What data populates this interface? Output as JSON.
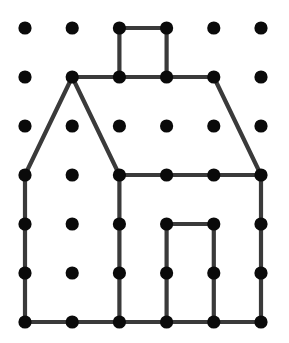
{
  "figure": {
    "name": "geoboard-house",
    "canvas": {
      "width": 289,
      "height": 343,
      "background": "#ffffff"
    },
    "grid": {
      "columns": 6,
      "rows": 7,
      "origin_x": 25,
      "origin_y": 28,
      "spacing_x": 47.2,
      "spacing_y": 49.0,
      "dot_radius": 6.6,
      "dot_color": "#0a0a0a",
      "dot_count": 42
    },
    "stroke": {
      "color": "#3a3a3a",
      "width": 4.2,
      "linecap": "round",
      "linejoin": "round"
    },
    "dots": [
      {
        "col": 0,
        "row": 0
      },
      {
        "col": 1,
        "row": 0
      },
      {
        "col": 2,
        "row": 0
      },
      {
        "col": 3,
        "row": 0
      },
      {
        "col": 4,
        "row": 0
      },
      {
        "col": 5,
        "row": 0
      },
      {
        "col": 0,
        "row": 1
      },
      {
        "col": 1,
        "row": 1
      },
      {
        "col": 2,
        "row": 1
      },
      {
        "col": 3,
        "row": 1
      },
      {
        "col": 4,
        "row": 1
      },
      {
        "col": 5,
        "row": 1
      },
      {
        "col": 0,
        "row": 2
      },
      {
        "col": 1,
        "row": 2
      },
      {
        "col": 2,
        "row": 2
      },
      {
        "col": 3,
        "row": 2
      },
      {
        "col": 4,
        "row": 2
      },
      {
        "col": 5,
        "row": 2
      },
      {
        "col": 0,
        "row": 3
      },
      {
        "col": 1,
        "row": 3
      },
      {
        "col": 2,
        "row": 3
      },
      {
        "col": 3,
        "row": 3
      },
      {
        "col": 4,
        "row": 3
      },
      {
        "col": 5,
        "row": 3
      },
      {
        "col": 0,
        "row": 4
      },
      {
        "col": 1,
        "row": 4
      },
      {
        "col": 2,
        "row": 4
      },
      {
        "col": 3,
        "row": 4
      },
      {
        "col": 4,
        "row": 4
      },
      {
        "col": 5,
        "row": 4
      },
      {
        "col": 0,
        "row": 5
      },
      {
        "col": 1,
        "row": 5
      },
      {
        "col": 2,
        "row": 5
      },
      {
        "col": 3,
        "row": 5
      },
      {
        "col": 4,
        "row": 5
      },
      {
        "col": 5,
        "row": 5
      },
      {
        "col": 0,
        "row": 6
      },
      {
        "col": 1,
        "row": 6
      },
      {
        "col": 2,
        "row": 6
      },
      {
        "col": 3,
        "row": 6
      },
      {
        "col": 4,
        "row": 6
      },
      {
        "col": 5,
        "row": 6
      }
    ],
    "segments": [
      {
        "name": "chimney-top",
        "from": {
          "col": 2,
          "row": 0
        },
        "to": {
          "col": 3,
          "row": 0
        }
      },
      {
        "name": "chimney-left",
        "from": {
          "col": 2,
          "row": 0
        },
        "to": {
          "col": 2,
          "row": 1
        }
      },
      {
        "name": "chimney-right",
        "from": {
          "col": 3,
          "row": 0
        },
        "to": {
          "col": 3,
          "row": 1
        }
      },
      {
        "name": "roof-ridge",
        "from": {
          "col": 1,
          "row": 1
        },
        "to": {
          "col": 4,
          "row": 1
        }
      },
      {
        "name": "roof-slope-left",
        "from": {
          "col": 1,
          "row": 1
        },
        "to": {
          "col": 0,
          "row": 3
        }
      },
      {
        "name": "roof-slope-inner",
        "from": {
          "col": 1,
          "row": 1
        },
        "to": {
          "col": 2,
          "row": 3
        }
      },
      {
        "name": "roof-slope-right",
        "from": {
          "col": 4,
          "row": 1
        },
        "to": {
          "col": 5,
          "row": 3
        }
      },
      {
        "name": "eaves-line",
        "from": {
          "col": 2,
          "row": 3
        },
        "to": {
          "col": 5,
          "row": 3
        }
      },
      {
        "name": "wall-left",
        "from": {
          "col": 0,
          "row": 3
        },
        "to": {
          "col": 0,
          "row": 6
        }
      },
      {
        "name": "wall-middle",
        "from": {
          "col": 2,
          "row": 3
        },
        "to": {
          "col": 2,
          "row": 6
        }
      },
      {
        "name": "wall-right",
        "from": {
          "col": 5,
          "row": 3
        },
        "to": {
          "col": 5,
          "row": 6
        }
      },
      {
        "name": "door-top",
        "from": {
          "col": 3,
          "row": 4
        },
        "to": {
          "col": 4,
          "row": 4
        }
      },
      {
        "name": "door-left",
        "from": {
          "col": 3,
          "row": 4
        },
        "to": {
          "col": 3,
          "row": 6
        }
      },
      {
        "name": "door-right",
        "from": {
          "col": 4,
          "row": 4
        },
        "to": {
          "col": 4,
          "row": 6
        }
      },
      {
        "name": "base-line",
        "from": {
          "col": 0,
          "row": 6
        },
        "to": {
          "col": 5,
          "row": 6
        }
      }
    ]
  }
}
